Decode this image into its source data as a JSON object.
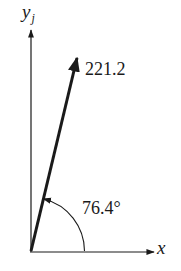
{
  "diagram": {
    "type": "vector-angle-diagram",
    "axes": {
      "x_label": "x",
      "y_label": "y",
      "y_subscript": "j"
    },
    "vector": {
      "magnitude_label": "221.2",
      "magnitude": 221.2,
      "angle_label": "76.4°",
      "angle_deg": 76.4,
      "reference_axis": "x"
    },
    "colors": {
      "ink": "#1a1a1a",
      "background": "#ffffff"
    }
  }
}
